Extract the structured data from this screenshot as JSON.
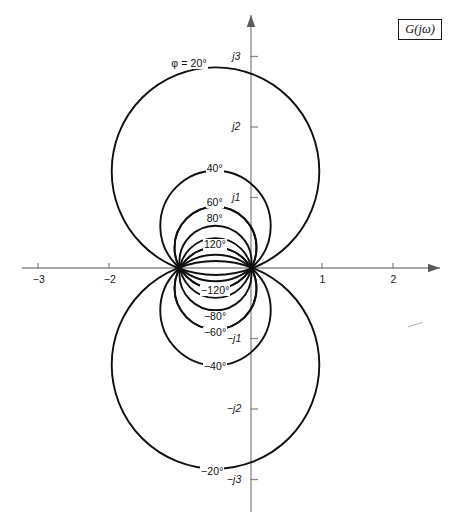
{
  "figure": {
    "kind": "complex-plane-constant-phase-loci",
    "legend_label": "G(jω)",
    "phi_prefix_label": "φ = 20°"
  },
  "chart_data": {
    "type": "line",
    "title": "",
    "subtitle": "",
    "xlabel": "",
    "ylabel": "",
    "xlim": [
      -3.55,
      2.85
    ],
    "ylim": [
      -3.55,
      3.55
    ],
    "grid": false,
    "legend_position": "top-right",
    "legend_entries": [
      "G(jω)"
    ],
    "origin_px": {
      "x": 251,
      "y": 268
    },
    "unit_px": {
      "x": 71,
      "y": 70.5
    },
    "x_ticks": [
      {
        "value": -3,
        "label": "−3"
      },
      {
        "value": -2,
        "label": "−2"
      },
      {
        "value": 1,
        "label": "1"
      },
      {
        "value": 2,
        "label": "2"
      }
    ],
    "y_ticks": [
      {
        "value": 3,
        "label": "j3"
      },
      {
        "value": 2,
        "label": "j2"
      },
      {
        "value": 1,
        "label": "j1"
      },
      {
        "value": -1,
        "label": "−j1"
      },
      {
        "value": -2,
        "label": "−j2"
      },
      {
        "value": -3,
        "label": "−j3"
      }
    ],
    "node_points": [
      {
        "x": -1,
        "y": 0
      },
      {
        "x": 0,
        "y": 0
      }
    ],
    "curve_family": {
      "description": "Constant phase loci (N-circles) of G through 0 and -1",
      "center_formula": "(-0.5, 0.5/tan(phi))",
      "radius_formula": "0.5/|sin(phi)|"
    },
    "series": [
      {
        "name": "φ = 20°",
        "phi_deg": 20,
        "label": "φ = 20°",
        "center": [
          -0.5,
          1.374
        ],
        "radius": 1.462,
        "label_anchor": [
          -0.86,
          2.9
        ]
      },
      {
        "name": "40°",
        "phi_deg": 40,
        "label": "40°",
        "center": [
          -0.5,
          0.596
        ],
        "radius": 0.778,
        "label_anchor": [
          -0.52,
          1.41
        ]
      },
      {
        "name": "60°",
        "phi_deg": 60,
        "label": "60°",
        "center": [
          -0.5,
          0.289
        ],
        "radius": 0.577,
        "label_anchor": [
          -0.52,
          0.92
        ]
      },
      {
        "name": "80°",
        "phi_deg": 80,
        "label": "80°",
        "center": [
          -0.5,
          0.088
        ],
        "radius": 0.508,
        "label_anchor": [
          -0.52,
          0.69
        ]
      },
      {
        "name": "120°",
        "phi_deg": 120,
        "label": "120°",
        "center": [
          -0.5,
          -0.289
        ],
        "radius": 0.577,
        "label_anchor": [
          -0.52,
          0.33
        ]
      },
      {
        "name": "−120°",
        "phi_deg": -120,
        "label": "−120°",
        "center": [
          -0.5,
          0.289
        ],
        "radius": 0.577,
        "label_anchor": [
          -0.52,
          -0.33
        ]
      },
      {
        "name": "−80°",
        "phi_deg": -80,
        "label": "−80°",
        "center": [
          -0.5,
          -0.088
        ],
        "radius": 0.508,
        "label_anchor": [
          -0.52,
          -0.69
        ]
      },
      {
        "name": "−60°",
        "phi_deg": -60,
        "label": "−60°",
        "center": [
          -0.5,
          -0.289
        ],
        "radius": 0.577,
        "label_anchor": [
          -0.52,
          -0.92
        ]
      },
      {
        "name": "−40°",
        "phi_deg": -40,
        "label": "−40°",
        "center": [
          -0.5,
          -0.596
        ],
        "radius": 0.778,
        "label_anchor": [
          -0.52,
          -1.41
        ]
      },
      {
        "name": "−20°",
        "phi_deg": -20,
        "label": "−20°",
        "center": [
          -0.5,
          -1.374
        ],
        "radius": 1.462,
        "label_anchor": [
          -0.56,
          -2.9
        ]
      }
    ]
  },
  "labels": {
    "x_tick_texts": [
      "−3",
      "−2",
      "1",
      "2"
    ],
    "y_tick_texts": [
      "j3",
      "j2",
      "j1",
      "−j1",
      "−j2",
      "−j3"
    ],
    "upper_curve_texts": [
      "φ = 20°",
      "40°",
      "60°",
      "80°",
      "120°"
    ],
    "lower_curve_texts": [
      "−120°",
      "−80°",
      "−60°",
      "−40°",
      "−20°"
    ]
  }
}
